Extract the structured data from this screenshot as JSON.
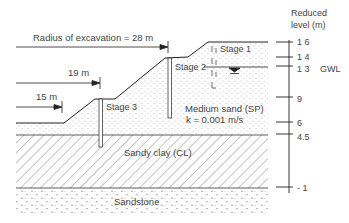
{
  "axis": {
    "title_line1": "Reduced",
    "title_line2": "level  (m)",
    "ticks": [
      {
        "label": "1 6",
        "value": 16
      },
      {
        "label": "1 4",
        "value": 14
      },
      {
        "label": "1 3",
        "value": 13
      },
      {
        "label": "9",
        "value": 9
      },
      {
        "label": "6",
        "value": 6
      },
      {
        "label": "4.5",
        "value": 4.5
      },
      {
        "label": "- 1",
        "value": -1
      }
    ],
    "gwl_label": "GWL"
  },
  "dimensions": {
    "radius_label": "Radius of excavation =  28 m",
    "r19_label": "19  m",
    "r15_label": "15  m"
  },
  "stages": {
    "stage1": "Stage 1",
    "stage2": "Stage 2",
    "stage3": "Stage 3"
  },
  "layers": {
    "sand_name": "Medium sand (SP)",
    "sand_k": "k  =  0.001  m/s",
    "clay_name": "Sandy clay (CL)",
    "rock_name": "Sandstone"
  },
  "colors": {
    "line": "#222222",
    "text": "#444444",
    "dots": "#888888",
    "hatch": "#555555"
  }
}
